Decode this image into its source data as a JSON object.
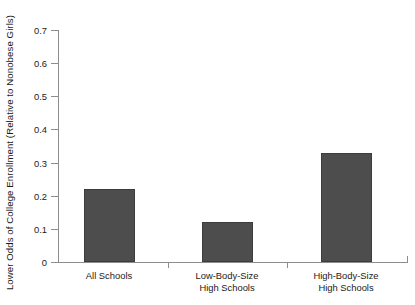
{
  "chart_data": {
    "type": "bar",
    "title": "",
    "subtitle": "",
    "xlabel": "",
    "ylabel": "Lower Odds of College Enrollment (Relative to Nonobese Girls)",
    "categories": [
      "All Schools",
      "Low-Body-Size\nHigh Schools",
      "High-Body-Size\nHigh Schools"
    ],
    "category_lines": [
      [
        "All Schools"
      ],
      [
        "Low-Body-Size",
        "High Schools"
      ],
      [
        "High-Body-Size",
        "High Schools"
      ]
    ],
    "values": [
      0.22,
      0.12,
      0.33
    ],
    "ylim": [
      0,
      0.7
    ],
    "ytick_values": [
      0,
      0.1,
      0.2,
      0.3,
      0.4,
      0.5,
      0.6,
      0.7
    ],
    "ytick_labels": [
      "0",
      "0.1",
      "0.2",
      "0.3",
      "0.4",
      "0.5",
      "0.6",
      "0.7"
    ],
    "grid": false,
    "legend": false,
    "legend_position": "none",
    "bar_color": "#4d4d4d",
    "bar_edge_color": "#3c3c3c",
    "axis_color": "#8d8d8d",
    "text_color": "#1a1a1a",
    "background_color": "#ffffff"
  },
  "axis": {
    "y_title": "Lower Odds of College Enrollment (Relative to Nonobese Girls)"
  },
  "ticks": {
    "y": [
      {
        "label": "0.7",
        "value": 0.7
      },
      {
        "label": "0.6",
        "value": 0.6
      },
      {
        "label": "0.5",
        "value": 0.5
      },
      {
        "label": "0.4",
        "value": 0.4
      },
      {
        "label": "0.3",
        "value": 0.3
      },
      {
        "label": "0.2",
        "value": 0.2
      },
      {
        "label": "0.1",
        "value": 0.1
      },
      {
        "label": "0",
        "value": 0
      }
    ]
  },
  "bars": [
    {
      "label_line1": "All Schools",
      "label_line2": "",
      "value": 0.22
    },
    {
      "label_line1": "Low-Body-Size",
      "label_line2": "High Schools",
      "value": 0.12
    },
    {
      "label_line1": "High-Body-Size",
      "label_line2": "High Schools",
      "value": 0.33
    }
  ]
}
